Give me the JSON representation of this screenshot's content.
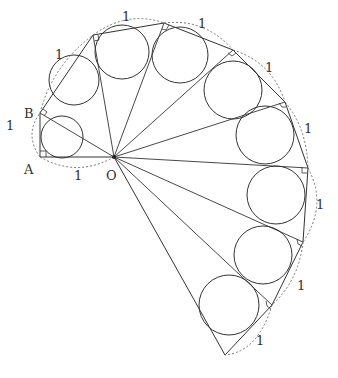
{
  "diagram": {
    "labels": {
      "A": "A",
      "B": "B",
      "O": "O"
    },
    "unit_label": "1",
    "colors": {
      "line": "#333333",
      "dashed_arc": "#777777",
      "background": "#ffffff"
    },
    "center_O": [
      114,
      157
    ],
    "vertices": [
      {
        "name": "A",
        "xy": [
          40,
          157
        ]
      },
      {
        "name": "B",
        "xy": [
          40,
          113
        ]
      },
      {
        "name": "P3",
        "xy": [
          93,
          35
        ]
      },
      {
        "name": "P4",
        "xy": [
          164,
          23
        ]
      },
      {
        "name": "P5",
        "xy": [
          233,
          50
        ]
      },
      {
        "name": "P6",
        "xy": [
          285,
          102
        ]
      },
      {
        "name": "P7",
        "xy": [
          308,
          168
        ]
      },
      {
        "name": "P8",
        "xy": [
          303,
          242
        ]
      },
      {
        "name": "P9",
        "xy": [
          272,
          305
        ]
      },
      {
        "name": "P10",
        "xy": [
          225,
          355
        ]
      }
    ],
    "triangle_count": 9,
    "outer_edge_length_labels": [
      "1",
      "1",
      "1",
      "1",
      "1",
      "1",
      "1",
      "1",
      "1",
      "1"
    ],
    "unit_label_positions": [
      [
        10,
        128
      ],
      [
        76,
        178
      ],
      [
        60,
        95
      ],
      [
        126,
        19
      ],
      [
        203,
        26
      ],
      [
        267,
        70
      ],
      [
        296,
        129
      ],
      [
        319,
        205
      ],
      [
        312,
        274
      ],
      [
        262,
        341
      ]
    ],
    "incircles": [
      {
        "cx": 62,
        "cy": 137,
        "r": 21
      },
      {
        "cx": 75,
        "cy": 83,
        "r": 25
      },
      {
        "cx": 123,
        "cy": 52,
        "r": 27
      },
      {
        "cx": 181,
        "cy": 61,
        "r": 28
      },
      {
        "cx": 232,
        "cy": 101,
        "r": 29
      },
      {
        "cx": 266,
        "cy": 136,
        "r": 29
      },
      {
        "cx": 276,
        "cy": 197,
        "r": 30
      },
      {
        "cx": 264,
        "cy": 253,
        "r": 30
      },
      {
        "cx": 238,
        "cy": 308,
        "r": 30
      }
    ]
  }
}
